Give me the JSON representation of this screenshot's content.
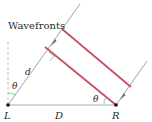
{
  "diagram": {
    "labels": {
      "wavefronts": "Wavefronts",
      "d": "d",
      "theta_left": "θ",
      "theta_right": "θ",
      "L": "L",
      "D": "D",
      "R": "R"
    },
    "colors": {
      "wavefront": "#c8505e",
      "ray": "#8a8a8a",
      "baseline": "#9a9a9a",
      "dashed": "#b0b0b0",
      "angle_arc": "#5fae9a",
      "point": "#111111"
    }
  }
}
